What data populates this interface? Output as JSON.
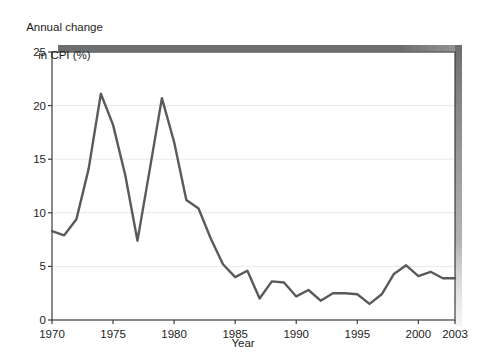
{
  "chart_data": {
    "type": "line",
    "title": "",
    "ylabel": "Annual change\nin CPI (%)",
    "ylabel_line1": "Annual change",
    "ylabel_line2": "in CPI (%)",
    "xlabel": "Year",
    "xlim": [
      1970,
      2003
    ],
    "ylim": [
      0,
      25
    ],
    "yticks": [
      0,
      5,
      10,
      15,
      20,
      25
    ],
    "ytick_labels": [
      "0",
      "5",
      "10",
      "15",
      "20",
      "25"
    ],
    "xticks": [
      1970,
      1975,
      1980,
      1985,
      1990,
      1995,
      2000,
      2003
    ],
    "xtick_labels": [
      "1970",
      "1975",
      "1980",
      "1985",
      "1990",
      "1995",
      "2000",
      "2003"
    ],
    "grid": "horizontal",
    "legend": "none",
    "line_color": "#5a5a5a",
    "grid_color": "#e9e9e9",
    "axis_color": "#3c3c3c",
    "shadow_color": "#6e6e6e",
    "x": [
      1970,
      1971,
      1972,
      1973,
      1974,
      1975,
      1976,
      1977,
      1978,
      1979,
      1980,
      1981,
      1982,
      1983,
      1984,
      1985,
      1986,
      1987,
      1988,
      1989,
      1990,
      1991,
      1992,
      1993,
      1994,
      1995,
      1996,
      1997,
      1998,
      1999,
      2000,
      2001,
      2002,
      2003
    ],
    "values": [
      8.3,
      7.9,
      9.4,
      14.1,
      21.1,
      18.2,
      13.5,
      7.4,
      14.0,
      20.7,
      16.6,
      11.2,
      10.4,
      7.6,
      5.2,
      4.0,
      4.6,
      2.0,
      3.6,
      3.5,
      2.2,
      2.8,
      1.8,
      2.5,
      2.5,
      2.4,
      1.5,
      2.4,
      4.3,
      5.1,
      4.1,
      4.5,
      3.9,
      3.9
    ],
    "series": [
      {
        "name": "Annual change in CPI (%)",
        "values": [
          8.3,
          7.9,
          9.4,
          14.1,
          21.1,
          18.2,
          13.5,
          7.4,
          14.0,
          20.7,
          16.6,
          11.2,
          10.4,
          7.6,
          5.2,
          4.0,
          4.6,
          2.0,
          3.6,
          3.5,
          2.2,
          2.8,
          1.8,
          2.5,
          2.5,
          2.4,
          1.5,
          2.4,
          4.3,
          5.1,
          4.1,
          4.5,
          3.9,
          3.9
        ]
      }
    ]
  },
  "plot": {
    "left": 52,
    "right": 455,
    "top": 52,
    "bottom": 320
  }
}
